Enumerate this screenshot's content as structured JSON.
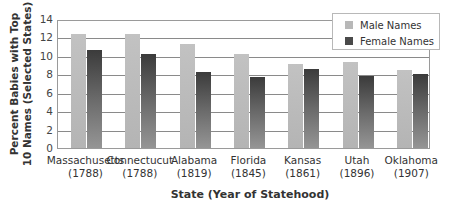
{
  "chart_data": {
    "type": "bar",
    "title": "",
    "ylabel": "Percent Babies  with Top 10 Names (Selected States)",
    "ylabel_lines": [
      "Percent Babies  with Top",
      "10 Names (Selected States)"
    ],
    "xlabel": "State (Year of Statehood)",
    "ylim": [
      0,
      14
    ],
    "yticks": [
      0,
      2,
      4,
      6,
      8,
      10,
      12,
      14
    ],
    "grid": true,
    "legend_position": "top-right",
    "categories": [
      "Massachusetts (1788)",
      "Connectucut (1788)",
      "Alabama (1819)",
      "Florida (1845)",
      "Kansas (1861)",
      "Utah (1896)",
      "Oklahoma (1907)"
    ],
    "category_names": [
      "Massachusetts",
      "Connectucut",
      "Alabama",
      "Florida",
      "Kansas",
      "Utah",
      "Oklahoma"
    ],
    "category_years": [
      "(1788)",
      "(1788)",
      "(1819)",
      "(1845)",
      "(1861)",
      "(1896)",
      "(1907)"
    ],
    "series": [
      {
        "name": "Male Names",
        "color": "#bcbcbc",
        "values": [
          12.4,
          12.4,
          11.3,
          10.2,
          9.1,
          9.3,
          8.5
        ]
      },
      {
        "name": "Female Names",
        "color": "#4a4a4a",
        "values": [
          10.6,
          10.2,
          8.2,
          7.7,
          8.6,
          7.8,
          8.0
        ]
      }
    ]
  }
}
